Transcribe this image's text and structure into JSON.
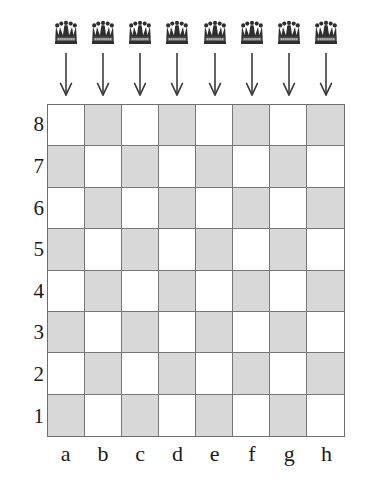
{
  "figure": {
    "type": "chessboard-diagram",
    "title": ""
  },
  "chart_data": {
    "type": "table",
    "title": "",
    "xlabel": "",
    "ylabel": "",
    "board": {
      "files": [
        "a",
        "b",
        "c",
        "d",
        "e",
        "f",
        "g",
        "h"
      ],
      "ranks": [
        "8",
        "7",
        "6",
        "5",
        "4",
        "3",
        "2",
        "1"
      ],
      "rows": 8,
      "columns": 8,
      "a1_color": "dark",
      "a8_color": "light",
      "colors": {
        "light_square": "#ffffff",
        "dark_square": "#d8d8d8",
        "grid_line": "#777777",
        "border": "#6e6e6e",
        "ink": "#1a1a1a"
      },
      "square_colors": [
        [
          "light",
          "dark",
          "light",
          "dark",
          "light",
          "dark",
          "light",
          "dark"
        ],
        [
          "dark",
          "light",
          "dark",
          "light",
          "dark",
          "light",
          "dark",
          "light"
        ],
        [
          "light",
          "dark",
          "light",
          "dark",
          "light",
          "dark",
          "light",
          "dark"
        ],
        [
          "dark",
          "light",
          "dark",
          "light",
          "dark",
          "light",
          "dark",
          "light"
        ],
        [
          "light",
          "dark",
          "light",
          "dark",
          "light",
          "dark",
          "light",
          "dark"
        ],
        [
          "dark",
          "light",
          "dark",
          "light",
          "dark",
          "light",
          "dark",
          "light"
        ],
        [
          "light",
          "dark",
          "light",
          "dark",
          "light",
          "dark",
          "light",
          "dark"
        ],
        [
          "dark",
          "light",
          "dark",
          "light",
          "dark",
          "light",
          "dark",
          "light"
        ]
      ]
    },
    "pieces_above_board": {
      "count": 8,
      "piece": "queen",
      "icon": "queen-crown-icon",
      "files": [
        "a",
        "b",
        "c",
        "d",
        "e",
        "f",
        "g",
        "h"
      ]
    },
    "arrows": {
      "count": 8,
      "direction": "down",
      "icon": "arrow-down-icon",
      "files": [
        "a",
        "b",
        "c",
        "d",
        "e",
        "f",
        "g",
        "h"
      ]
    }
  },
  "labels": {
    "files": [
      "a",
      "b",
      "c",
      "d",
      "e",
      "f",
      "g",
      "h"
    ],
    "ranks": [
      "8",
      "7",
      "6",
      "5",
      "4",
      "3",
      "2",
      "1"
    ]
  }
}
